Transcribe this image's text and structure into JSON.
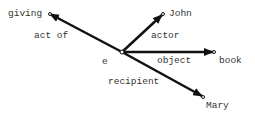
{
  "diagram": {
    "center_node": "e",
    "nodes": {
      "giving": "giving",
      "john": "John",
      "book": "book",
      "mary": "Mary"
    },
    "edges": {
      "act_of": "act of",
      "actor": "actor",
      "object": "object",
      "recipient": "recipient"
    },
    "colors": {
      "line": "#111111",
      "text": "#333333"
    }
  }
}
